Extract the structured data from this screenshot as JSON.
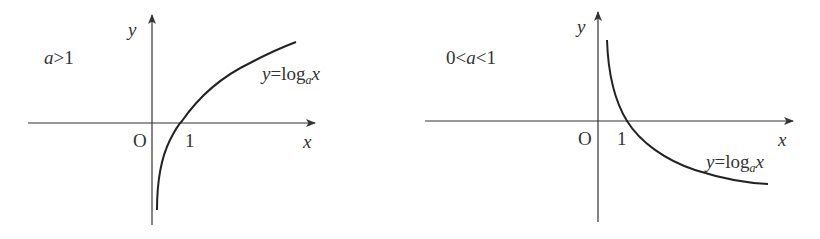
{
  "figure": {
    "panels": [
      {
        "id": "left",
        "condition": {
          "prefix": "",
          "var": "a",
          "rel1": ">",
          "num": "1",
          "rel0": "",
          "lead": ""
        },
        "condition_text": "a>1",
        "axis_labels": {
          "x": "x",
          "y": "y",
          "origin": "O",
          "tick": "1"
        },
        "equation": {
          "lhs": "y",
          "eq": "=",
          "fn": "log",
          "base": "a",
          "arg": "x"
        },
        "curve_type": "increasing"
      },
      {
        "id": "right",
        "condition_text": "0<a<1",
        "condition": {
          "lead": "0",
          "rel0": "<",
          "var": "a",
          "rel1": "<",
          "num": "1"
        },
        "axis_labels": {
          "x": "x",
          "y": "y",
          "origin": "O",
          "tick": "1"
        },
        "equation": {
          "lhs": "y",
          "eq": "=",
          "fn": "log",
          "base": "a",
          "arg": "x"
        },
        "curve_type": "decreasing"
      }
    ],
    "colors": {
      "axis": "#333333",
      "curve": "#222222",
      "text": "#333333"
    }
  }
}
